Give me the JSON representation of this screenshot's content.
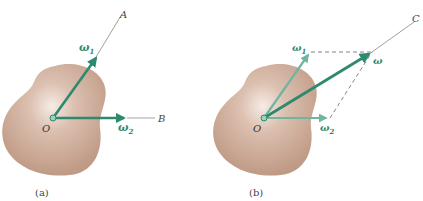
{
  "figure": {
    "colors": {
      "body": "#c9a590",
      "body_highlight": "#f3e6df",
      "vector_dark": "#2e8a6e",
      "vector_light": "#6fb5a0",
      "label": "#2e8a6e",
      "axis_line": "#888888",
      "text": "#333333"
    },
    "panels": [
      {
        "id": "a",
        "caption": "(a)",
        "origin_label": "O",
        "axis_labels": {
          "A": "A",
          "B": "B"
        },
        "vectors": [
          {
            "name": "omega_1",
            "label": "ω",
            "subscript": "1"
          },
          {
            "name": "omega_2",
            "label": "ω",
            "subscript": "2"
          }
        ]
      },
      {
        "id": "b",
        "caption": "(b)",
        "origin_label": "O",
        "axis_labels": {
          "C": "C"
        },
        "vectors": [
          {
            "name": "omega_1",
            "label": "ω",
            "subscript": "1"
          },
          {
            "name": "omega_2",
            "label": "ω",
            "subscript": "2"
          },
          {
            "name": "omega",
            "label": "ω",
            "subscript": ""
          }
        ]
      }
    ]
  }
}
